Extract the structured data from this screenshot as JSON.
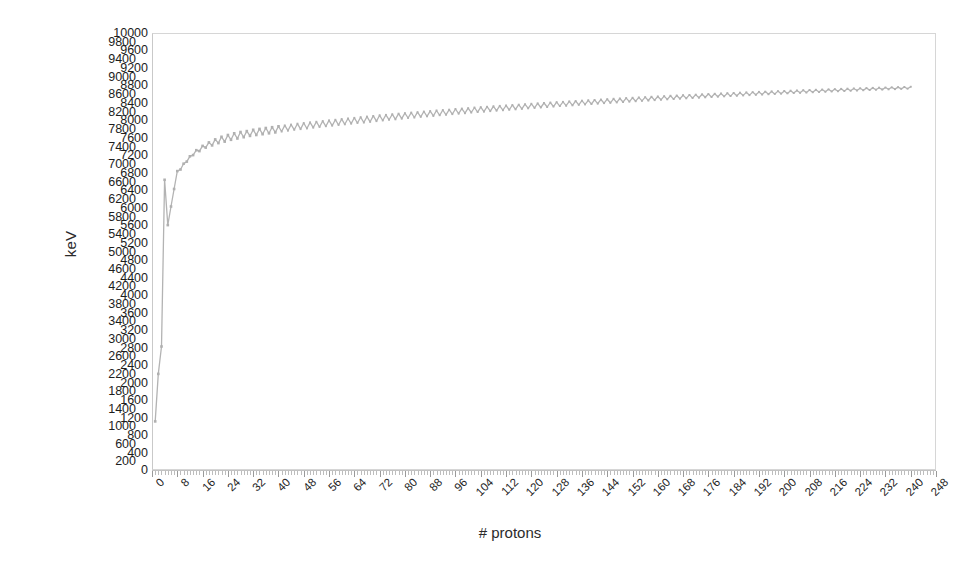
{
  "chart_data": {
    "type": "line",
    "title": "",
    "xlabel": "# protons",
    "ylabel": "keV",
    "xlim": [
      0,
      248
    ],
    "ylim": [
      0,
      10000
    ],
    "grid": false,
    "legend": "none",
    "series_name": "binding energy",
    "line_color": "#b3b3b3",
    "marker": "square",
    "y_tick_step": 200,
    "y_ticks": [
      0,
      200,
      400,
      600,
      800,
      1000,
      1200,
      1400,
      1600,
      1800,
      2000,
      2200,
      2400,
      2600,
      2800,
      3000,
      3200,
      3400,
      3600,
      3800,
      4000,
      4200,
      4400,
      4600,
      4800,
      5000,
      5200,
      5400,
      5600,
      5800,
      6000,
      6200,
      6400,
      6600,
      6800,
      7000,
      7200,
      7400,
      7600,
      7800,
      8000,
      8200,
      8400,
      8600,
      8800,
      9000,
      9200,
      9400,
      9600,
      9800,
      10000
    ],
    "x_tick_step": 8,
    "x_ticks": [
      0,
      8,
      16,
      24,
      32,
      40,
      48,
      56,
      64,
      72,
      80,
      88,
      96,
      104,
      112,
      120,
      128,
      136,
      144,
      152,
      160,
      168,
      176,
      184,
      192,
      200,
      208,
      216,
      224,
      232,
      240,
      248
    ],
    "x_minor_step": 1,
    "x": [
      1,
      2,
      3,
      4,
      5,
      6,
      7,
      8,
      9,
      10,
      11,
      12,
      13,
      14,
      15,
      16,
      17,
      18,
      19,
      20,
      21,
      22,
      23,
      24,
      25,
      26,
      27,
      28,
      29,
      30,
      31,
      32,
      33,
      34,
      35,
      36,
      37,
      38,
      39,
      40,
      41,
      42,
      43,
      44,
      45,
      46,
      47,
      48,
      49,
      50,
      51,
      52,
      53,
      54,
      55,
      56,
      57,
      58,
      59,
      60,
      61,
      62,
      63,
      64,
      65,
      66,
      67,
      68,
      69,
      70,
      71,
      72,
      73,
      74,
      75,
      76,
      77,
      78,
      79,
      80,
      81,
      82,
      83,
      84,
      85,
      86,
      87,
      88,
      89,
      90,
      91,
      92,
      93,
      94,
      95,
      96,
      97,
      98,
      99,
      100,
      101,
      102,
      103,
      104,
      105,
      106,
      107,
      108,
      109,
      110,
      111,
      112,
      113,
      114,
      115,
      116,
      117,
      118,
      119,
      120,
      121,
      122,
      123,
      124,
      125,
      126,
      127,
      128,
      129,
      130,
      131,
      132,
      133,
      134,
      135,
      136,
      137,
      138,
      139,
      140,
      141,
      142,
      143,
      144,
      145,
      146,
      147,
      148,
      149,
      150,
      151,
      152,
      153,
      154,
      155,
      156,
      157,
      158,
      159,
      160,
      161,
      162,
      163,
      164,
      165,
      166,
      167,
      168,
      169,
      170,
      171,
      172,
      173,
      174,
      175,
      176,
      177,
      178,
      179,
      180,
      181,
      182,
      183,
      184,
      185,
      186,
      187,
      188,
      189,
      190,
      191,
      192,
      193,
      194,
      195,
      196,
      197,
      198,
      199,
      200,
      201,
      202,
      203,
      204,
      205,
      206,
      207,
      208,
      209,
      210,
      211,
      212,
      213,
      214,
      215,
      216,
      217,
      218,
      219,
      220,
      221,
      222,
      223,
      224,
      225,
      226,
      227,
      228,
      229,
      230,
      231,
      232,
      233,
      234,
      235,
      236,
      237,
      238,
      239,
      240
    ],
    "y": [
      1112,
      2200,
      2827,
      6640,
      5605,
      6030,
      6430,
      6840,
      6880,
      7000,
      7070,
      7160,
      7230,
      7290,
      7330,
      7380,
      7420,
      7450,
      7480,
      7510,
      7540,
      7560,
      7580,
      7600,
      7620,
      7640,
      7650,
      7670,
      7680,
      7690,
      7710,
      7720,
      7730,
      7740,
      7750,
      7760,
      7770,
      7780,
      7790,
      7800,
      7810,
      7820,
      7830,
      7840,
      7850,
      7860,
      7865,
      7875,
      7880,
      7890,
      7900,
      7905,
      7915,
      7920,
      7930,
      7935,
      7945,
      7950,
      7960,
      7965,
      7975,
      7980,
      7990,
      7995,
      8005,
      8010,
      8015,
      8025,
      8030,
      8040,
      8045,
      8055,
      8060,
      8065,
      8075,
      8080,
      8085,
      8095,
      8100,
      8105,
      8115,
      8120,
      8125,
      8130,
      8140,
      8145,
      8150,
      8155,
      8160,
      8170,
      8175,
      8180,
      8185,
      8190,
      8200,
      8205,
      8210,
      8215,
      8220,
      8225,
      8235,
      8240,
      8245,
      8250,
      8255,
      8260,
      8265,
      8270,
      8275,
      8280,
      8285,
      8290,
      8295,
      8300,
      8305,
      8310,
      8315,
      8320,
      8325,
      8330,
      8335,
      8340,
      8345,
      8350,
      8355,
      8360,
      8365,
      8370,
      8375,
      8378,
      8383,
      8388,
      8392,
      8397,
      8402,
      8406,
      8411,
      8415,
      8420,
      8424,
      8429,
      8433,
      8438,
      8442,
      8446,
      8451,
      8455,
      8459,
      8463,
      8468,
      8472,
      8476,
      8480,
      8484,
      8488,
      8492,
      8496,
      8500,
      8504,
      8508,
      8512,
      8516,
      8520,
      8524,
      8527,
      8531,
      8535,
      8539,
      8542,
      8546,
      8550,
      8553,
      8557,
      8560,
      8564,
      8567,
      8571,
      8574,
      8578,
      8581,
      8585,
      8588,
      8591,
      8595,
      8598,
      8601,
      8605,
      8608,
      8611,
      8614,
      8617,
      8621,
      8624,
      8627,
      8630,
      8633,
      8636,
      8639,
      8642,
      8645,
      8648,
      8651,
      8654,
      8657,
      8660,
      8663,
      8666,
      8668,
      8671,
      8674,
      8677,
      8680,
      8682,
      8685,
      8688,
      8690,
      8693,
      8696,
      8698,
      8701,
      8703,
      8706,
      8708,
      8711,
      8713,
      8716,
      8718,
      8721,
      8723,
      8726,
      8728,
      8730,
      8733,
      8735,
      8737,
      8740,
      8742,
      8744,
      8746,
      8749,
      8751,
      8753,
      8755
    ],
    "odd_even_amplitude": 130
  },
  "axes": {
    "y_title": "keV",
    "x_title": "# protons"
  }
}
